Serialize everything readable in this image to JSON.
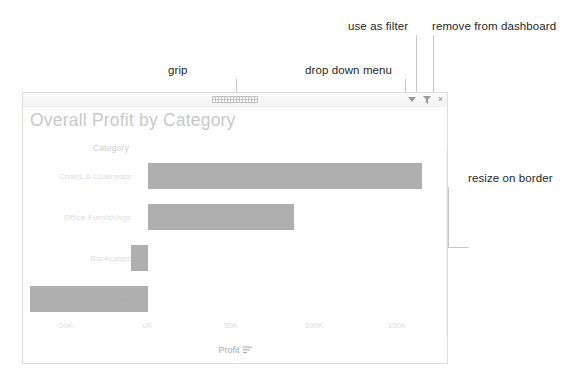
{
  "annotations": [
    {
      "name": "grip",
      "label": "grip",
      "x": 168,
      "y": 64
    },
    {
      "name": "drop-down-menu",
      "label": "drop down menu",
      "x": 305,
      "y": 64
    },
    {
      "name": "use-as-filter",
      "label": "use as filter",
      "x": 348,
      "y": 20
    },
    {
      "name": "remove-from-dashboard",
      "label": "remove from dashboard",
      "x": 432,
      "y": 20
    },
    {
      "name": "resize-on-border",
      "label": "resize on border",
      "x": 468,
      "y": 172
    }
  ],
  "panel": {
    "titlebar": {
      "grip_name": "grip-handle",
      "icons": [
        {
          "name": "chevron-down-icon",
          "glyph": "caret"
        },
        {
          "name": "filter-funnel-icon",
          "glyph": "funnel"
        },
        {
          "name": "close-icon",
          "glyph": "×"
        }
      ]
    },
    "title": "Overall Profit by Category",
    "category_header": "Category"
  },
  "chart_data": {
    "type": "bar",
    "orientation": "horizontal",
    "title": "Overall Profit by Category",
    "xlabel": "Profit",
    "ylabel": "Category",
    "categories": [
      "Chairs & Chairmats",
      "Office Furnishings",
      "Bookcases",
      "Tables"
    ],
    "values": [
      165000,
      88000,
      -10000,
      -71000
    ],
    "xlim": [
      -75000,
      180000
    ],
    "ticks": [
      {
        "label": "-50K",
        "value": -50000
      },
      {
        "label": "0K",
        "value": 0
      },
      {
        "label": "50K",
        "value": 50000
      },
      {
        "label": "100K",
        "value": 100000
      },
      {
        "label": "150K",
        "value": 150000
      }
    ],
    "grid": false,
    "legend": "none",
    "bar_color": "#a8a8a8",
    "sort_indicator": "descending"
  },
  "colors": {
    "panel_border": "#dcdcdc",
    "title_text": "#c9c9c9",
    "annotation_text": "#262626",
    "leader_line": "#c9c9c9",
    "bar": "#a8a8a8"
  }
}
